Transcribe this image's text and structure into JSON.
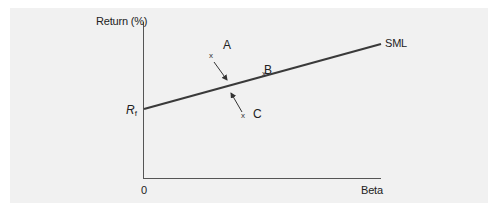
{
  "diagram": {
    "type": "security_market_line",
    "y_axis_label": "Return (%)",
    "x_axis_label": "Beta",
    "origin_label": "0",
    "intercept_label": {
      "main": "R",
      "sub": "f"
    },
    "line_label": "SML",
    "points": [
      {
        "label": "A",
        "marker": "x",
        "position": "above_line",
        "arrow": "points_down_to_line"
      },
      {
        "label": "B",
        "marker": "x",
        "position": "on_line"
      },
      {
        "label": "C",
        "marker": "x",
        "position": "below_line",
        "arrow": "points_up_to_line"
      }
    ],
    "colors": {
      "panel_background": "#f1f1f1",
      "line": "#3a3a3a",
      "axis": "#555555",
      "text": "#222222"
    }
  }
}
